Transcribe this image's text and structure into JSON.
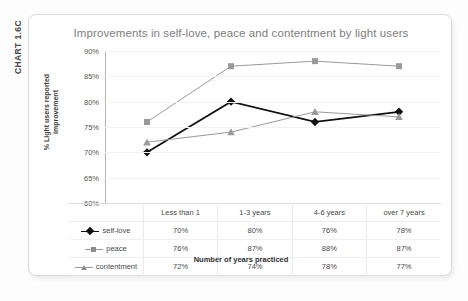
{
  "chart_code_label": "CHART 1.6C",
  "chart_data": {
    "type": "line",
    "title": "Improvements in self-love, peace and contentment by light users",
    "xlabel": "Number of years practiced",
    "ylabel": "% Light users reported improvement",
    "ylabel_line1": "% Light users reported",
    "ylabel_line2": "improvement",
    "categories": [
      "Less than 1",
      "1-3 years",
      "4-6 years",
      "over 7 years"
    ],
    "series": [
      {
        "name": "self-love",
        "values": [
          70,
          80,
          76,
          78
        ],
        "marker": "diamond",
        "color": "#111111"
      },
      {
        "name": "peace",
        "values": [
          76,
          87,
          88,
          87
        ],
        "marker": "square",
        "color": "#9a9a9a"
      },
      {
        "name": "contentment",
        "values": [
          72,
          74,
          78,
          77
        ],
        "marker": "triangle",
        "color": "#9a9a9a"
      }
    ],
    "value_labels": [
      [
        "70%",
        "80%",
        "76%",
        "78%"
      ],
      [
        "76%",
        "87%",
        "88%",
        "87%"
      ],
      [
        "72%",
        "74%",
        "78%",
        "77%"
      ]
    ],
    "ylim": [
      60,
      90
    ],
    "yticks": [
      90,
      85,
      80,
      75,
      70,
      65,
      60
    ],
    "ytick_labels": [
      "90%",
      "85%",
      "80%",
      "75%",
      "70%",
      "65%",
      "60%"
    ],
    "grid": true,
    "legend_position": "table-left-column"
  },
  "colors": {
    "series_dark": "#111111",
    "series_gray": "#9a9a9a",
    "frame_border": "#d9d9d9",
    "title_text": "#7d7d7d",
    "gridline": "#f2f2f2"
  }
}
